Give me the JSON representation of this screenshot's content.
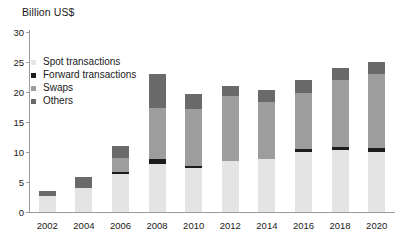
{
  "chart_data": {
    "type": "bar",
    "title": "",
    "subtitle": "",
    "xlabel": "",
    "ylabel": "Billion US$",
    "ylim": [
      0,
      30
    ],
    "ytick_values": [
      0,
      5,
      10,
      15,
      20,
      25,
      30
    ],
    "ytick_labels": [
      "0",
      "5",
      "10",
      "15",
      "20",
      "25",
      "30"
    ],
    "grid": false,
    "stacked": true,
    "legend_position": "upper-left-inside",
    "categories": [
      "2002",
      "2004",
      "2006",
      "2008",
      "2010",
      "2012",
      "2014",
      "2016",
      "2018",
      "2020"
    ],
    "series": [
      {
        "name": "Spot transactions",
        "color": "#e4e4e4",
        "values": [
          2.6,
          4.0,
          6.3,
          8.0,
          7.3,
          8.5,
          8.8,
          10.0,
          10.3,
          10.0
        ]
      },
      {
        "name": "Forward transactions",
        "color": "#1c1c1c",
        "values": [
          0.0,
          0.0,
          0.4,
          0.9,
          0.3,
          0.0,
          0.0,
          0.5,
          0.5,
          0.6
        ]
      },
      {
        "name": "Swaps",
        "color": "#9d9d9d",
        "values": [
          0.0,
          0.0,
          2.3,
          8.5,
          9.5,
          10.9,
          9.6,
          9.3,
          11.2,
          12.4
        ]
      },
      {
        "name": "Others",
        "color": "#6a6a6a",
        "values": [
          0.9,
          1.8,
          2.0,
          5.6,
          2.5,
          1.6,
          1.9,
          2.2,
          2.0,
          2.0
        ]
      }
    ],
    "totals": [
      3.5,
      5.8,
      11.0,
      23.0,
      19.6,
      21.0,
      20.3,
      22.0,
      24.0,
      25.0
    ]
  },
  "axis": {
    "y_title": "Billion US$"
  },
  "colors": {
    "axis": "#9a9a9a",
    "text": "#1a1a1a",
    "background": "#ffffff"
  }
}
